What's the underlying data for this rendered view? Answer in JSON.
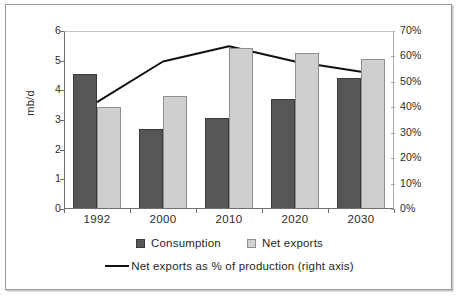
{
  "chart_data": {
    "type": "bar",
    "title": "",
    "subtitle": "",
    "xlabel": "",
    "ylabel": "mb/d",
    "categories": [
      "1992",
      "2000",
      "2010",
      "2020",
      "2030"
    ],
    "ylim": [
      0,
      6
    ],
    "yticks": [
      "0",
      "1",
      "2",
      "3",
      "4",
      "5",
      "6"
    ],
    "y2label": "",
    "y2lim": [
      0,
      70
    ],
    "y2ticks": [
      "0%",
      "10%",
      "20%",
      "30%",
      "40%",
      "50%",
      "60%",
      "70%"
    ],
    "grid": false,
    "legend_position": "bottom",
    "series": [
      {
        "name": "Consumption",
        "type": "bar",
        "axis": "left",
        "unit": "mb/d",
        "color": "#575757",
        "values": [
          4.55,
          2.7,
          3.07,
          3.7,
          4.42
        ]
      },
      {
        "name": "Net exports",
        "type": "bar",
        "axis": "left",
        "unit": "mb/d",
        "color": "#cfcfcf",
        "values": [
          3.43,
          3.8,
          5.42,
          5.27,
          5.05
        ]
      },
      {
        "name": "Net exports as % of production (right axis)",
        "type": "line",
        "axis": "right",
        "unit": "%",
        "color": "#111111",
        "values": [
          42,
          58,
          64,
          58,
          54
        ]
      }
    ]
  },
  "axes": {
    "left_title": "mb/d"
  },
  "legend": {
    "consumption": "Consumption",
    "net_exports": "Net exports",
    "line_series": "Net exports as % of production (right axis)"
  }
}
